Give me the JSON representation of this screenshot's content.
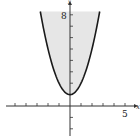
{
  "chart_data": {
    "type": "area",
    "title": "",
    "function": "y = x^2 + 1",
    "region": "y >= x^2 + 1 (shaded above curve)",
    "xlabel": "x",
    "ylabel": "y",
    "xlim": [
      -6.3,
      6.3
    ],
    "ylim": [
      -3,
      9
    ],
    "x_tick_step": 1,
    "y_tick_step": 1,
    "labeled_ticks": {
      "x": [
        5
      ],
      "y": [
        8
      ]
    },
    "grid": false,
    "x": [
      -2.7,
      -2,
      -1,
      0,
      1,
      2,
      2.7
    ],
    "values": [
      8.29,
      5,
      2,
      1,
      2,
      5,
      8.29
    ],
    "colors": {
      "fill": "#e6e6e6",
      "curve": "#1a1a1a",
      "axis": "#333333"
    }
  },
  "labels": {
    "x_axis": "x",
    "y_axis": "y",
    "x_tick_label": "5",
    "y_tick_label": "8"
  }
}
